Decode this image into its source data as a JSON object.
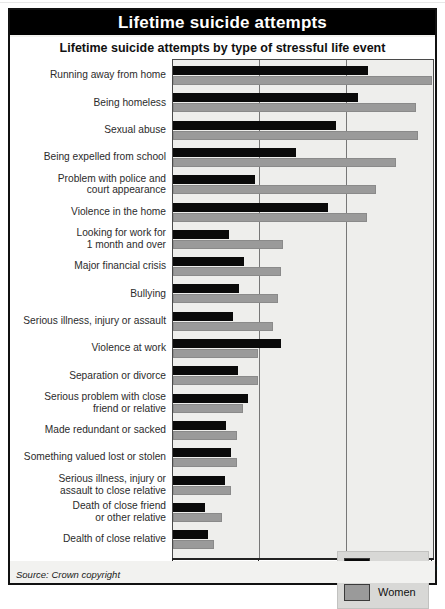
{
  "header": {
    "banner_title": "Lifetime suicide attempts",
    "subtitle": "Lifetime suicide attempts by type of stressful life event"
  },
  "footer": {
    "source": "Source: Crown copyright",
    "percent_symbol": "%"
  },
  "legend": {
    "position": "bottom-right",
    "items": [
      {
        "label": "Men",
        "color": "#0a0a0a"
      },
      {
        "label": "Women",
        "color": "#9a9a9a"
      }
    ]
  },
  "chart_data": {
    "type": "bar",
    "orientation": "horizontal",
    "title": "Lifetime suicide attempts by type of stressful life event",
    "xlabel": "%",
    "ylabel": "",
    "xlim": [
      0,
      30
    ],
    "xticks": [
      0,
      10,
      20,
      30
    ],
    "xticklabels": [
      "0",
      "10",
      "20",
      "30"
    ],
    "grid": true,
    "legend_entries": [
      "Men",
      "Women"
    ],
    "categories": [
      "Running away from home",
      "Being homeless",
      "Sexual abuse",
      "Being expelled  from school",
      "Problem with police and court appearance",
      "Violence in the home",
      "Looking for work for 1 month and over",
      "Major financial crisis",
      "Bullying",
      "Serious illness, injury or assault",
      "Violence at work",
      "Separation or divorce",
      "Serious problem with close friend or relative",
      "Made redundant or sacked",
      "Something valued lost or stolen",
      "Serious illness, injury or assault to close relative",
      "Death of close friend or other relative",
      "Dealth of close relative"
    ],
    "category_lines": [
      [
        "Running away from home"
      ],
      [
        "Being homeless"
      ],
      [
        "Sexual abuse"
      ],
      [
        "Being expelled  from school"
      ],
      [
        "Problem with police and",
        "court appearance"
      ],
      [
        "Violence in the home"
      ],
      [
        "Looking for work for",
        "1 month and over"
      ],
      [
        "Major financial crisis"
      ],
      [
        "Bullying"
      ],
      [
        "Serious illness, injury or assault"
      ],
      [
        "Violence at work"
      ],
      [
        "Separation or divorce"
      ],
      [
        "Serious problem with close",
        "friend or relative"
      ],
      [
        "Made redundant or sacked"
      ],
      [
        "Something valued lost or stolen"
      ],
      [
        "Serious illness, injury or",
        "assault to close relative"
      ],
      [
        "Death of close friend",
        "or other relative"
      ],
      [
        "Dealth of close relative"
      ]
    ],
    "series": [
      {
        "name": "Men",
        "color": "#0a0a0a",
        "values": [
          22.6,
          21.4,
          18.9,
          14.3,
          9.5,
          17.9,
          6.5,
          8.2,
          7.7,
          7.0,
          12.5,
          7.5,
          8.7,
          6.1,
          6.7,
          6.0,
          3.7,
          4.0
        ]
      },
      {
        "name": "Women",
        "color": "#9a9a9a",
        "values": [
          30.0,
          28.2,
          28.4,
          25.8,
          23.5,
          22.5,
          12.7,
          12.5,
          12.2,
          11.6,
          9.9,
          9.9,
          8.1,
          7.4,
          7.4,
          6.7,
          5.7,
          4.8
        ]
      }
    ]
  }
}
